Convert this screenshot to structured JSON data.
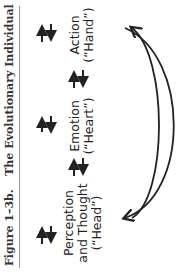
{
  "figure": {
    "label": "Figure 1–3b.",
    "title": "The Evolutionary Individual",
    "nodes": [
      {
        "line1": "Perception",
        "line2": "and Thought",
        "line3": "(“Head”)"
      },
      {
        "line1": "Emotion",
        "line2": "(“Heart”)"
      },
      {
        "line1": "Action",
        "line2": "(“Hand”)"
      }
    ],
    "connectors": [
      "bidirectional-arrow",
      "bidirectional-arrow"
    ],
    "feedback_loops": [
      "double-arc Action to Perception",
      "double-arc Perception to Action"
    ],
    "colors": {
      "ink": "#222222",
      "rule": "#999999"
    }
  }
}
